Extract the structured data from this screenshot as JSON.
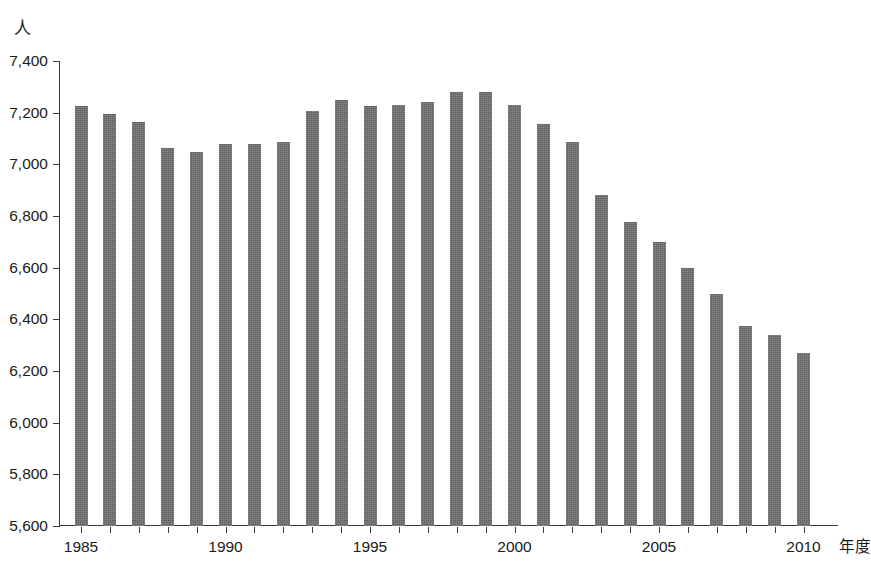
{
  "chart_data": {
    "type": "bar",
    "title": "",
    "subtitle": "",
    "xlabel": "年度",
    "ylabel": "人",
    "ylim": [
      5600,
      7400
    ],
    "ytick_step": 200,
    "yticks": [
      "7,400",
      "7,200",
      "7,000",
      "6,800",
      "6,600",
      "6,400",
      "6,200",
      "6,000",
      "5,800",
      "5,600"
    ],
    "ytick_values": [
      7400,
      7200,
      7000,
      6800,
      6600,
      6400,
      6200,
      6000,
      5800,
      5600
    ],
    "xticks_labeled": [
      "1985",
      "1990",
      "1995",
      "2000",
      "2005",
      "2010"
    ],
    "grid": false,
    "legend": null,
    "bar_color": "#6d6d6d",
    "axis_color": "#3a3a3a",
    "categories": [
      "1985",
      "1986",
      "1987",
      "1988",
      "1989",
      "1990",
      "1991",
      "1992",
      "1993",
      "1994",
      "1995",
      "1996",
      "1997",
      "1998",
      "1999",
      "2000",
      "2001",
      "2002",
      "2003",
      "2004",
      "2005",
      "2006",
      "2007",
      "2008",
      "2009",
      "2010"
    ],
    "values": [
      7225,
      7193,
      7162,
      7065,
      7048,
      7080,
      7080,
      7085,
      7208,
      7248,
      7225,
      7230,
      7240,
      7280,
      7280,
      7230,
      7155,
      7085,
      6880,
      6775,
      6700,
      6600,
      6500,
      6375,
      6340,
      6270
    ]
  }
}
